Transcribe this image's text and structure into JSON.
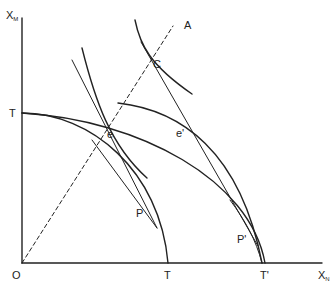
{
  "diagram": {
    "type": "economics-ppf-diagram",
    "axes": {
      "x_label": "X",
      "x_label_sub": "N",
      "y_label": "X",
      "y_label_sub": "M",
      "origin_label": "O"
    },
    "points": {
      "T_y": "T",
      "T_x": "T",
      "T_prime": "T'",
      "A": "A",
      "C": "C",
      "e": "e",
      "e_prime": "e'",
      "P": "P",
      "P_prime": "P'"
    },
    "colors": {
      "line": "#222222",
      "background": "#ffffff"
    }
  }
}
